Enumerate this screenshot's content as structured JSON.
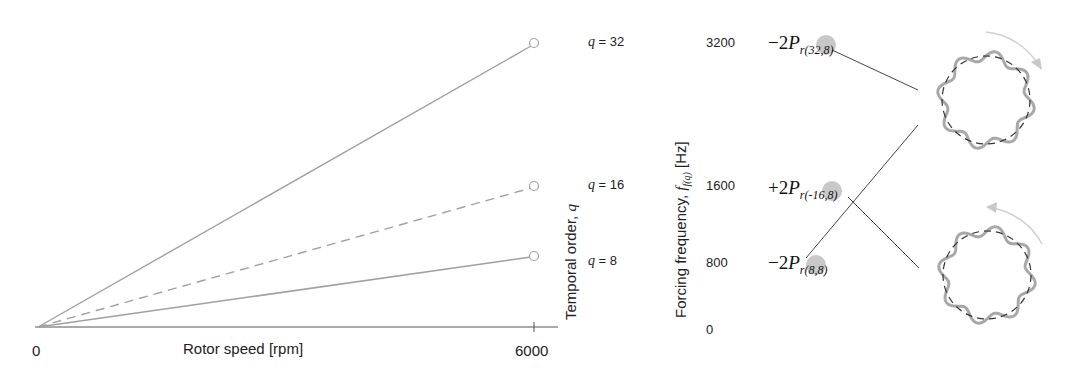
{
  "chart_data": {
    "type": "line",
    "title": "",
    "xlabel": "Rotor speed [rpm]",
    "ylabel": "Temporal order, q",
    "secondary_ylabel": "Forcing frequency, f_f(q) [Hz]",
    "x_ticks": [
      "0",
      "6000"
    ],
    "xlim": [
      0,
      6000
    ],
    "series": [
      {
        "name": "q = 32",
        "x": [
          0,
          6000
        ],
        "y": [
          0,
          3200
        ],
        "style": "solid"
      },
      {
        "name": "q = 16",
        "x": [
          0,
          6000
        ],
        "y": [
          0,
          1600
        ],
        "style": "dashed"
      },
      {
        "name": "q = 8",
        "x": [
          0,
          6000
        ],
        "y": [
          0,
          800
        ],
        "style": "solid"
      }
    ],
    "frequency_ticks": [
      "3200",
      "1600",
      "800",
      "0"
    ],
    "grid": false,
    "legend": "inline end labels"
  },
  "axes": {
    "x_label": "Rotor speed [rpm]",
    "x_tick_0": "0",
    "x_tick_max": "6000",
    "temporal_label_text": "Temporal order, ",
    "temporal_label_var": "q",
    "freq_label_text": "Forcing frequency, ",
    "freq_label_var": "f",
    "freq_label_sub": "f(q)",
    "freq_label_unit": " [Hz]"
  },
  "order_labels": [
    {
      "var": "q",
      "text": " = 32"
    },
    {
      "var": "q",
      "text": " = 16"
    },
    {
      "var": "q",
      "text": " = 8"
    }
  ],
  "frequency_ticks": [
    "3200",
    "1600",
    "800",
    "0"
  ],
  "modes": [
    {
      "sign": "−2",
      "symbol": "P",
      "sub": "r(32,8)"
    },
    {
      "sign": "+2",
      "symbol": "P",
      "sub": "r(-16,8)"
    },
    {
      "sign": "−2",
      "symbol": "P",
      "sub": "r(8,8)"
    }
  ],
  "rings": [
    {
      "rotation": "clockwise",
      "lobes": 8
    },
    {
      "rotation": "counter-clockwise",
      "lobes": 8
    }
  ],
  "colors": {
    "line": "#a0a0a0",
    "axis": "#555555",
    "marker_dot": "#c8c8c8",
    "connector": "#444444",
    "ring": "#a8a8a8",
    "ring_dash": "#333333",
    "arrow": "#c8c8c8"
  }
}
